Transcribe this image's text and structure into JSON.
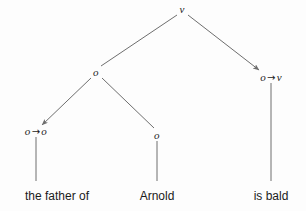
{
  "diagram": {
    "background_color": "#fdfdfd",
    "line_color": "#6e6e6e",
    "text_color": "#1b1b1b",
    "arrow_glyph": "→",
    "nodes": [
      {
        "id": "root",
        "label": "v",
        "x": 182,
        "y": 9,
        "kind": "category"
      },
      {
        "id": "left-o",
        "label": "o",
        "x": 96,
        "y": 72,
        "kind": "category"
      },
      {
        "id": "right-o-v",
        "label": "o → v",
        "x": 271,
        "y": 77,
        "kind": "category"
      },
      {
        "id": "left-o-o",
        "label": "o → o",
        "x": 36,
        "y": 131,
        "kind": "category"
      },
      {
        "id": "mid-o",
        "label": "o",
        "x": 157,
        "y": 135,
        "kind": "category"
      }
    ],
    "leaves": [
      {
        "id": "leaf-father",
        "label": "the father of",
        "x": 57,
        "y": 190
      },
      {
        "id": "leaf-arnold",
        "label": "Arnold",
        "x": 157,
        "y": 190
      },
      {
        "id": "leaf-bald",
        "label": "is bald",
        "x": 271,
        "y": 190
      }
    ],
    "edges": [
      {
        "id": "root-to-left-o",
        "from": "root",
        "to": "left-o",
        "style": "plain",
        "x1": 177,
        "y1": 15,
        "x2": 101,
        "y2": 66
      },
      {
        "id": "root-to-right-o-v",
        "from": "root",
        "to": "right-o-v",
        "style": "arrow",
        "x1": 188,
        "y1": 15,
        "x2": 259,
        "y2": 70
      },
      {
        "id": "left-o-to-o-o",
        "from": "left-o",
        "to": "left-o-o",
        "style": "arrow",
        "x1": 91,
        "y1": 78,
        "x2": 42,
        "y2": 125
      },
      {
        "id": "left-o-to-mid-o",
        "from": "left-o",
        "to": "mid-o",
        "style": "plain",
        "x1": 102,
        "y1": 78,
        "x2": 154,
        "y2": 128
      },
      {
        "id": "o-o-to-father",
        "from": "left-o-o",
        "to": "leaf-father",
        "style": "vertical",
        "x1": 36,
        "y1": 137,
        "x2": 36,
        "y2": 181
      },
      {
        "id": "mid-o-to-arnold",
        "from": "mid-o",
        "to": "leaf-arnold",
        "style": "vertical",
        "x1": 157,
        "y1": 141,
        "x2": 157,
        "y2": 181
      },
      {
        "id": "o-v-to-bald",
        "from": "right-o-v",
        "to": "leaf-bald",
        "style": "vertical",
        "x1": 271,
        "y1": 83,
        "x2": 271,
        "y2": 181
      }
    ]
  }
}
